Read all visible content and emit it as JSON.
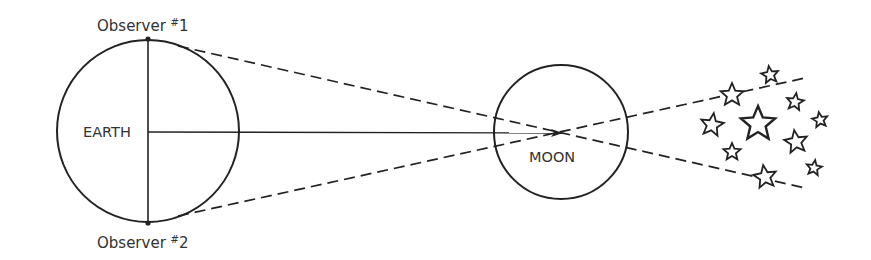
{
  "diagram": {
    "labels": {
      "earth": "EARTH",
      "moon": "MOON",
      "observer1_prefix": "Observer ",
      "observer1_sup": "#",
      "observer1_num": "1",
      "observer2_prefix": "Observer ",
      "observer2_sup": "#",
      "observer2_num": "2"
    },
    "colors": {
      "ink": "#222222",
      "background": "#ffffff"
    },
    "bodies": {
      "earth": {
        "cx": 148,
        "cy": 131,
        "r": 91
      },
      "moon": {
        "cx": 561,
        "cy": 132,
        "r": 67
      }
    },
    "observers": [
      {
        "name": "Observer #1",
        "x": 148,
        "y": 39
      },
      {
        "name": "Observer #2",
        "x": 148,
        "y": 223
      }
    ],
    "sight_lines_end": [
      {
        "from": "Observer #1",
        "x": 805,
        "y": 188
      },
      {
        "from": "Observer #2",
        "x": 805,
        "y": 78
      }
    ],
    "stars": [
      {
        "x": 770,
        "y": 75,
        "r": 9
      },
      {
        "x": 732,
        "y": 95,
        "r": 12
      },
      {
        "x": 795,
        "y": 102,
        "r": 9
      },
      {
        "x": 820,
        "y": 120,
        "r": 8
      },
      {
        "x": 758,
        "y": 124,
        "r": 18
      },
      {
        "x": 712,
        "y": 125,
        "r": 12
      },
      {
        "x": 796,
        "y": 142,
        "r": 12
      },
      {
        "x": 732,
        "y": 152,
        "r": 9
      },
      {
        "x": 814,
        "y": 168,
        "r": 8
      },
      {
        "x": 765,
        "y": 177,
        "r": 12
      }
    ]
  }
}
